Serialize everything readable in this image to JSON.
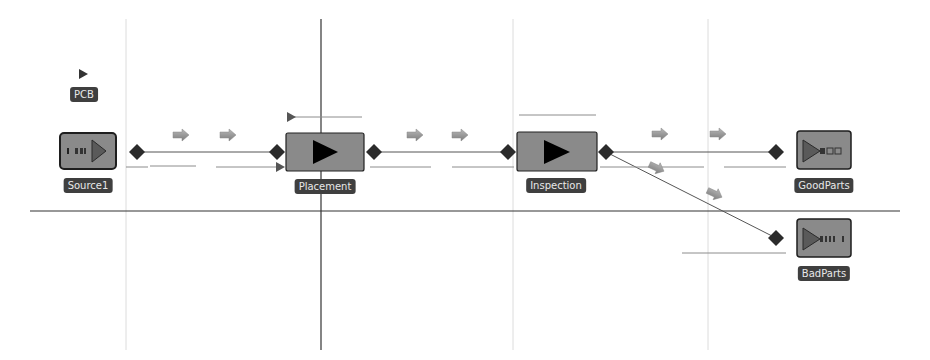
{
  "diagram": {
    "type": "process-flow",
    "entity": {
      "label": "PCB",
      "x": 83,
      "y": 95
    },
    "nodes": [
      {
        "id": "source1",
        "label": "Source1",
        "kind": "source",
        "x": 88,
        "y": 153,
        "w": 56,
        "h": 36
      },
      {
        "id": "placement",
        "label": "Placement",
        "kind": "process",
        "x": 325,
        "y": 152,
        "w": 78,
        "h": 38
      },
      {
        "id": "inspection",
        "label": "Inspection",
        "kind": "process",
        "x": 556,
        "y": 152,
        "w": 80,
        "h": 38
      },
      {
        "id": "goodparts",
        "label": "GoodParts",
        "kind": "sink",
        "x": 824,
        "y": 150,
        "w": 54,
        "h": 38
      },
      {
        "id": "badparts",
        "label": "BadParts",
        "kind": "sink",
        "x": 824,
        "y": 238,
        "w": 54,
        "h": 38
      }
    ],
    "connections": [
      {
        "from": "Source1",
        "to": "Placement"
      },
      {
        "from": "Placement",
        "to": "Inspection"
      },
      {
        "from": "Inspection",
        "to": "GoodParts"
      },
      {
        "from": "Inspection",
        "to": "BadParts"
      }
    ],
    "colors": {
      "node_fill": "#8a8a8a",
      "node_border": "#222222",
      "label_bg": "#3f3f3f",
      "label_text": "#e8e8e8",
      "port": "#2b2b2b",
      "flow_arrow": "#9a9a9a",
      "grid": "#d8d8d8",
      "axis": "#333333"
    }
  }
}
